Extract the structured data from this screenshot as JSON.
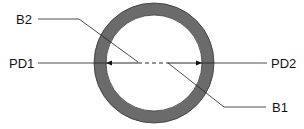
{
  "diagram": {
    "type": "pipe cross-section",
    "labels": {
      "b2": "B2",
      "pd1": "PD1",
      "pd2": "PD2",
      "b1": "B1"
    },
    "colors": {
      "ring": "#6b6b6b",
      "ring_edge": "#333333",
      "line": "#222222",
      "background": "#ffffff"
    }
  }
}
